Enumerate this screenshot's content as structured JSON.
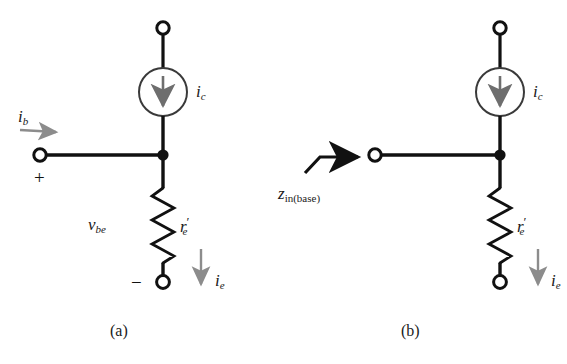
{
  "figure": {
    "type": "circuit-diagram",
    "background_color": "#ffffff",
    "line_color": "#111111",
    "accent_gray": "#8c8c8c"
  },
  "panels": [
    {
      "id": "a",
      "caption": "(a)",
      "labels": {
        "base_current": "i",
        "base_current_sub": "b",
        "collector_current": "i",
        "collector_current_sub": "c",
        "emitter_current": "i",
        "emitter_current_sub": "e",
        "resistor": "r",
        "resistor_prime": "′",
        "resistor_sub": "e",
        "voltage": "v",
        "voltage_sub": "be",
        "plus_sign": "+",
        "minus_sign": "−"
      },
      "components": [
        {
          "name": "top-terminal",
          "kind": "open-node"
        },
        {
          "name": "current-source",
          "kind": "circle-arrow-down"
        },
        {
          "name": "base-terminal",
          "kind": "open-node"
        },
        {
          "name": "junction",
          "kind": "filled-node"
        },
        {
          "name": "resistor",
          "kind": "zigzag"
        },
        {
          "name": "bottom-terminal",
          "kind": "open-node"
        }
      ]
    },
    {
      "id": "b",
      "caption": "(b)",
      "labels": {
        "input_impedance": "z",
        "input_impedance_sub": "in(base)",
        "collector_current": "i",
        "collector_current_sub": "c",
        "emitter_current": "i",
        "emitter_current_sub": "e",
        "resistor": "r",
        "resistor_prime": "′",
        "resistor_sub": "e"
      },
      "components": [
        {
          "name": "top-terminal",
          "kind": "open-node"
        },
        {
          "name": "current-source",
          "kind": "circle-arrow-down"
        },
        {
          "name": "base-terminal",
          "kind": "open-node"
        },
        {
          "name": "junction",
          "kind": "filled-node"
        },
        {
          "name": "resistor",
          "kind": "zigzag"
        },
        {
          "name": "bottom-terminal",
          "kind": "open-node"
        },
        {
          "name": "impedance-pointer",
          "kind": "bent-arrow"
        }
      ]
    }
  ]
}
